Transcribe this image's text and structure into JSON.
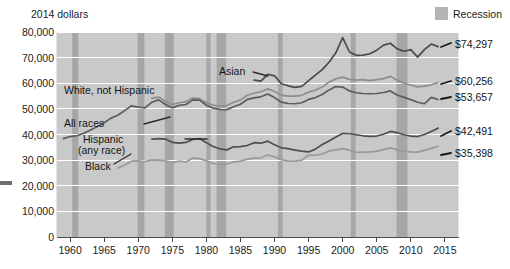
{
  "axis_title": "2014 dollars",
  "legend": {
    "label": "Recession",
    "swatch_color": "#b4b4b4"
  },
  "value_labels": [
    {
      "id": "asian",
      "text": "$74,297"
    },
    {
      "id": "white",
      "text": "$60,256"
    },
    {
      "id": "allraces",
      "text": "$53,657"
    },
    {
      "id": "hispanic",
      "text": "$42,491"
    },
    {
      "id": "black",
      "text": "$35,398"
    }
  ],
  "series_labels": [
    {
      "id": "asian",
      "text": "Asian"
    },
    {
      "id": "white",
      "text": "White, not Hispanic"
    },
    {
      "id": "allraces",
      "text": "All races"
    },
    {
      "id": "hispanic1",
      "text": "Hispanic"
    },
    {
      "id": "hispanic2",
      "text": "(any race)"
    },
    {
      "id": "black",
      "text": "Black"
    }
  ],
  "chart_data": {
    "type": "line",
    "title": "",
    "subtitle": "",
    "xlabel": "",
    "ylabel": "2014 dollars",
    "ylim": [
      0,
      80000
    ],
    "xlim": [
      1958,
      2017
    ],
    "yticks": [
      0,
      10000,
      20000,
      30000,
      40000,
      50000,
      60000,
      70000,
      80000
    ],
    "ytick_labels": [
      "0",
      "10,000",
      "20,000",
      "30,000",
      "40,000",
      "50,000",
      "60,000",
      "70,000",
      "80,000"
    ],
    "xticks": [
      1960,
      1965,
      1970,
      1975,
      1980,
      1985,
      1990,
      1995,
      2000,
      2005,
      2010,
      2015
    ],
    "xtick_labels": [
      "1960",
      "1965",
      "1970",
      "1975",
      "1980",
      "1985",
      "1990",
      "1995",
      "2000",
      "2005",
      "2010",
      "2015"
    ],
    "grid": "horizontal",
    "legend_position": "top-right",
    "plot_bg": "#c9c9c9",
    "recession_color": "#a6a6a6",
    "recession_bands": [
      [
        1960.3,
        1961.2
      ],
      [
        1969.9,
        1970.9
      ],
      [
        1973.9,
        1975.2
      ],
      [
        1980.0,
        1980.6
      ],
      [
        1981.5,
        1982.9
      ],
      [
        1990.5,
        1991.2
      ],
      [
        2001.2,
        2001.9
      ],
      [
        2007.9,
        2009.5
      ]
    ],
    "series": [
      {
        "name": "Asian",
        "color": "#4a4a4a",
        "end_label": "$74,297",
        "x": [
          1987,
          1988,
          1989,
          1990,
          1991,
          1992,
          1993,
          1994,
          1995,
          1996,
          1997,
          1998,
          1999,
          2000,
          2001,
          2002,
          2003,
          2004,
          2005,
          2006,
          2007,
          2008,
          2009,
          2010,
          2011,
          2012,
          2013,
          2014
        ],
        "values": [
          61200,
          60800,
          63500,
          62900,
          59800,
          59000,
          58400,
          58800,
          61000,
          63200,
          65300,
          68200,
          71900,
          77800,
          72200,
          70900,
          71000,
          71500,
          72900,
          74900,
          75600,
          73400,
          72500,
          73100,
          70200,
          73100,
          75300,
          74297
        ]
      },
      {
        "name": "White, not Hispanic",
        "color": "#8e8e8e",
        "end_label": "$60,256",
        "x": [
          1972,
          1973,
          1974,
          1975,
          1976,
          1977,
          1978,
          1979,
          1980,
          1981,
          1982,
          1983,
          1984,
          1985,
          1986,
          1987,
          1988,
          1989,
          1990,
          1991,
          1992,
          1993,
          1994,
          1995,
          1996,
          1997,
          1998,
          1999,
          2000,
          2001,
          2002,
          2003,
          2004,
          2005,
          2006,
          2007,
          2008,
          2009,
          2010,
          2011,
          2012,
          2013,
          2014
        ],
        "values": [
          54100,
          54600,
          52900,
          51700,
          52400,
          52800,
          54300,
          54000,
          52400,
          51500,
          51000,
          51300,
          52600,
          53500,
          55300,
          56100,
          56700,
          57800,
          56800,
          55400,
          55000,
          55000,
          55300,
          56600,
          57300,
          58500,
          60500,
          61700,
          62400,
          61500,
          61200,
          61400,
          61000,
          61400,
          61800,
          62700,
          61200,
          60000,
          59300,
          58600,
          58900,
          59400,
          60256
        ]
      },
      {
        "name": "All races",
        "color": "#5c5c5c",
        "end_label": "$53,657",
        "x": [
          1959,
          1960,
          1961,
          1962,
          1963,
          1964,
          1965,
          1966,
          1967,
          1968,
          1969,
          1970,
          1971,
          1972,
          1973,
          1974,
          1975,
          1976,
          1977,
          1978,
          1979,
          1980,
          1981,
          1982,
          1983,
          1984,
          1985,
          1986,
          1987,
          1988,
          1989,
          1990,
          1991,
          1992,
          1993,
          1994,
          1995,
          1996,
          1997,
          1998,
          1999,
          2000,
          2001,
          2002,
          2003,
          2004,
          2005,
          2006,
          2007,
          2008,
          2009,
          2010,
          2011,
          2012,
          2013,
          2014
        ],
        "values": [
          38400,
          39200,
          39500,
          40500,
          41800,
          43100,
          44600,
          46400,
          47500,
          49300,
          51200,
          50700,
          50400,
          52600,
          53500,
          51700,
          50400,
          51400,
          51700,
          53500,
          53400,
          51400,
          50300,
          49800,
          49700,
          50800,
          51800,
          53700,
          54300,
          54700,
          55800,
          54400,
          52600,
          52100,
          52000,
          52400,
          53700,
          54400,
          55600,
          57400,
          58700,
          58500,
          57000,
          56300,
          56000,
          55900,
          56000,
          56400,
          57000,
          55400,
          54500,
          53600,
          52600,
          52000,
          54500,
          53657
        ]
      },
      {
        "name": "Hispanic (any race)",
        "color": "#4f4f4f",
        "end_label": "$42,491",
        "x": [
          1972,
          1973,
          1974,
          1975,
          1976,
          1977,
          1978,
          1979,
          1980,
          1981,
          1982,
          1983,
          1984,
          1985,
          1986,
          1987,
          1988,
          1989,
          1990,
          1991,
          1992,
          1993,
          1994,
          1995,
          1996,
          1997,
          1998,
          1999,
          2000,
          2001,
          2002,
          2003,
          2004,
          2005,
          2006,
          2007,
          2008,
          2009,
          2010,
          2011,
          2012,
          2013,
          2014
        ],
        "values": [
          38200,
          38400,
          38200,
          36900,
          36600,
          36900,
          38100,
          38400,
          36800,
          35300,
          34400,
          34000,
          35200,
          35300,
          35700,
          36800,
          36600,
          37400,
          36000,
          34800,
          34500,
          33900,
          33500,
          33200,
          34300,
          36100,
          37500,
          39000,
          40400,
          40300,
          39900,
          39500,
          39300,
          39400,
          40100,
          41200,
          40700,
          39900,
          39400,
          39200,
          40000,
          41200,
          42491
        ]
      },
      {
        "name": "Black",
        "color": "#9a9a9a",
        "end_label": "$35,398",
        "x": [
          1967,
          1968,
          1969,
          1970,
          1971,
          1972,
          1973,
          1974,
          1975,
          1976,
          1977,
          1978,
          1979,
          1980,
          1981,
          1982,
          1983,
          1984,
          1985,
          1986,
          1987,
          1988,
          1989,
          1990,
          1991,
          1992,
          1993,
          1994,
          1995,
          1996,
          1997,
          1998,
          1999,
          2000,
          2001,
          2002,
          2003,
          2004,
          2005,
          2006,
          2007,
          2008,
          2009,
          2010,
          2011,
          2012,
          2013,
          2014
        ],
        "values": [
          26900,
          28100,
          29600,
          29700,
          29400,
          30100,
          30000,
          29700,
          29000,
          29600,
          29300,
          30800,
          30600,
          29800,
          28700,
          28300,
          28500,
          29300,
          29600,
          30400,
          30800,
          30900,
          32000,
          31300,
          30200,
          29600,
          29600,
          30000,
          32000,
          31900,
          32400,
          33600,
          34000,
          34500,
          33900,
          33000,
          33100,
          33200,
          33400,
          34100,
          34800,
          34000,
          33400,
          33200,
          33100,
          33800,
          34600,
          35398
        ]
      }
    ]
  }
}
